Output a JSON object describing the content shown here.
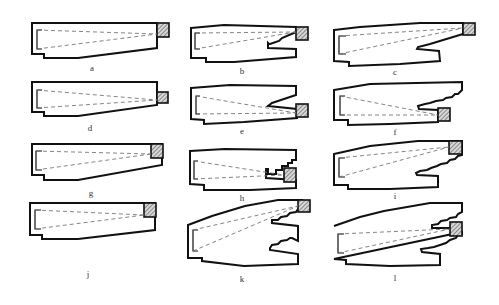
{
  "figure": {
    "panels": [
      {
        "id": "a",
        "label": "a"
      },
      {
        "id": "b",
        "label": "b"
      },
      {
        "id": "c",
        "label": "c"
      },
      {
        "id": "d",
        "label": "d"
      },
      {
        "id": "e",
        "label": "e"
      },
      {
        "id": "f",
        "label": "f"
      },
      {
        "id": "g",
        "label": "g"
      },
      {
        "id": "h",
        "label": "h"
      },
      {
        "id": "i",
        "label": "i"
      },
      {
        "id": "j",
        "label": "j"
      },
      {
        "id": "k",
        "label": "k"
      },
      {
        "id": "l",
        "label": "l"
      }
    ],
    "colors": {
      "outline": "#111111",
      "dashed_line": "#777777",
      "hatch": "#555555",
      "background": "#ffffff"
    }
  }
}
